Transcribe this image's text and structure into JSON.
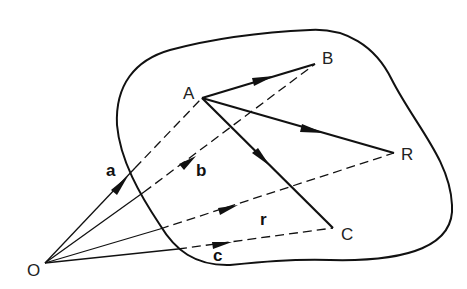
{
  "figure": {
    "stroke_color": "#111111",
    "background": "#ffffff"
  },
  "points": {
    "O": {
      "label": "O",
      "x": 45,
      "y": 263
    },
    "A": {
      "label": "A",
      "x": 202,
      "y": 98
    },
    "B": {
      "label": "B",
      "x": 315,
      "y": 64
    },
    "R": {
      "label": "R",
      "x": 394,
      "y": 153
    },
    "C": {
      "label": "C",
      "x": 333,
      "y": 228
    }
  },
  "vectors": [
    {
      "name": "a",
      "label": "a",
      "from": "O",
      "to": "A"
    },
    {
      "name": "b",
      "label": "b",
      "from": "O",
      "to": "B"
    },
    {
      "name": "r",
      "label": "r",
      "from": "O",
      "to": "R"
    },
    {
      "name": "c",
      "label": "c",
      "from": "O",
      "to": "C"
    }
  ],
  "body_vectors": [
    {
      "from": "A",
      "to": "B"
    },
    {
      "from": "A",
      "to": "R"
    },
    {
      "from": "A",
      "to": "C"
    }
  ],
  "labels": {
    "O": "O",
    "A": "A",
    "B": "B",
    "R": "R",
    "C": "C",
    "a": "a",
    "b": "b",
    "r": "r",
    "c": "c"
  }
}
